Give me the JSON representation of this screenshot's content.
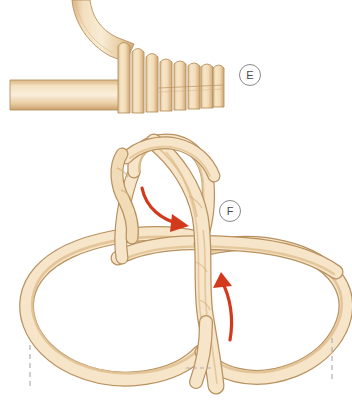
{
  "figure": {
    "background_color": "#ffffff",
    "width": 352,
    "height": 401
  },
  "colors": {
    "rope_light": "#f7e7cd",
    "rope_mid": "#ecd0a4",
    "rope_shadow": "#d8b381",
    "rope_outline": "#b79263",
    "arrow_red": "#d33a1c",
    "dashed_guide": "#b9a9b5",
    "label_ring": "#8a8a8a",
    "label_text": "#4a4a4a"
  },
  "panels": [
    {
      "id": "panel-e",
      "label": "E",
      "label_position": {
        "x": 239,
        "y": 64
      },
      "description": "Rope with whipping coils wrapped around standing part",
      "coil_count": 8,
      "elements": [
        {
          "name": "standing-rope-horizontal",
          "x1": 10,
          "y1": 94,
          "x2": 122,
          "y2": 94
        },
        {
          "name": "working-rope-curved",
          "from": {
            "x": 78,
            "y": 0
          },
          "to": {
            "x": 124,
            "y": 60
          }
        },
        {
          "name": "whipping-coils",
          "from_x": 118,
          "to_x": 224,
          "top_y": 42,
          "bottom_y": 112
        }
      ]
    },
    {
      "id": "panel-f",
      "label": "F",
      "label_position": {
        "x": 219,
        "y": 200
      },
      "description": "Two large rope loops with twisted central bight and two directional arrows",
      "elements": [
        {
          "name": "upper-bight-loop",
          "cx": 172,
          "cy": 190
        },
        {
          "name": "left-loop",
          "cx": 128,
          "cy": 300,
          "rx": 100,
          "ry": 68
        },
        {
          "name": "right-loop",
          "cx": 248,
          "cy": 298,
          "rx": 92,
          "ry": 66
        },
        {
          "name": "twisted-vertical-strand",
          "top_y": 140,
          "bottom_y": 385
        }
      ],
      "arrows": [
        {
          "name": "arrow-down-right",
          "color": "#d33a1c",
          "start": {
            "x": 144,
            "y": 190
          },
          "end": {
            "x": 187,
            "y": 222
          },
          "direction": "down-right"
        },
        {
          "name": "arrow-up",
          "color": "#d33a1c",
          "start": {
            "x": 230,
            "y": 338
          },
          "end": {
            "x": 221,
            "y": 277
          },
          "direction": "up"
        }
      ],
      "guides": [
        {
          "name": "dashed-guide-left",
          "x": 30,
          "y1": 345,
          "y2": 387,
          "orientation": "vertical"
        },
        {
          "name": "dashed-guide-right",
          "x": 332,
          "y1": 338,
          "y2": 382,
          "orientation": "vertical"
        },
        {
          "name": "dashed-guide-center",
          "x1": 186,
          "x2": 211,
          "y": 368,
          "orientation": "horizontal"
        }
      ]
    }
  ]
}
